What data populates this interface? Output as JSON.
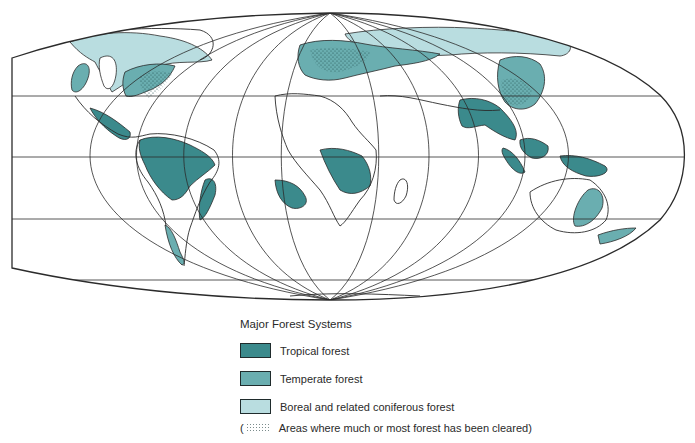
{
  "map": {
    "title": "World map of major forest systems",
    "projection": "pseudocylindrical (flat-polar)",
    "colors": {
      "tropical": "#3b8a8c",
      "temperate": "#6aaeb0",
      "boreal": "#b9dde0",
      "outline": "#2b2b2b",
      "ocean": "#ffffff"
    }
  },
  "legend": {
    "title": "Major Forest Systems",
    "items": [
      {
        "key": "tropical",
        "label": "Tropical forest",
        "color": "#3b8a8c"
      },
      {
        "key": "temperate",
        "label": "Temperate forest",
        "color": "#6aaeb0"
      },
      {
        "key": "boreal",
        "label": "Boreal and related coniferous forest",
        "color": "#b9dde0"
      }
    ],
    "cleared": {
      "open_paren": "(",
      "label": "Areas where much or most forest has been cleared)"
    }
  }
}
